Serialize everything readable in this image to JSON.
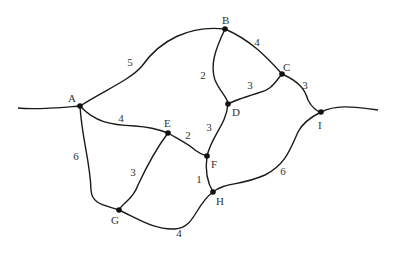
{
  "diagram": {
    "type": "weighted-graph",
    "nodes": [
      {
        "id": "A",
        "label": "A",
        "x": 80,
        "y": 106,
        "lx": 68,
        "ly": 102
      },
      {
        "id": "B",
        "label": "B",
        "x": 225,
        "y": 29,
        "lx": 222,
        "ly": 24
      },
      {
        "id": "C",
        "label": "C",
        "x": 282,
        "y": 74,
        "lx": 283,
        "ly": 71
      },
      {
        "id": "D",
        "label": "D",
        "x": 228,
        "y": 104,
        "lx": 232,
        "ly": 116
      },
      {
        "id": "E",
        "label": "E",
        "x": 168,
        "y": 133,
        "lx": 164,
        "ly": 127
      },
      {
        "id": "F",
        "label": "F",
        "x": 207,
        "y": 156,
        "lx": 211,
        "ly": 168
      },
      {
        "id": "G",
        "label": "G",
        "x": 119,
        "y": 210,
        "lx": 111,
        "ly": 224
      },
      {
        "id": "H",
        "label": "H",
        "x": 213,
        "y": 192,
        "lx": 216,
        "ly": 205
      },
      {
        "id": "I",
        "label": "I",
        "x": 321,
        "y": 112,
        "lx": 318,
        "ly": 129
      }
    ],
    "edges": [
      {
        "from": "A",
        "to": "B",
        "weight": "5",
        "wx": 130,
        "wy": 66,
        "path": "M80,106 C105,90 130,80 142,66 C160,40 190,25 225,29"
      },
      {
        "from": "A",
        "to": "E",
        "weight": "4",
        "wx": 121,
        "wy": 122,
        "path": "M80,106 C95,122 110,125 135,126 C150,127 160,130 168,133"
      },
      {
        "from": "A",
        "to": "G",
        "weight": "6",
        "wx": 76,
        "wy": 160,
        "path": "M80,106 C82,140 90,160 91,190 C92,205 105,205 119,210"
      },
      {
        "from": "B",
        "to": "C",
        "weight": "4",
        "wx": 257,
        "wy": 46,
        "path": "M225,29 C250,40 265,55 282,74"
      },
      {
        "from": "B",
        "to": "D",
        "weight": "2",
        "wx": 203,
        "wy": 79,
        "path": "M225,29 C215,50 210,65 215,80 C220,92 228,98 228,104"
      },
      {
        "from": "C",
        "to": "D",
        "weight": "3",
        "wx": 250,
        "wy": 89,
        "path": "M282,74 C275,82 272,90 258,93 C245,97 235,100 228,104"
      },
      {
        "from": "C",
        "to": "I",
        "weight": "3",
        "wx": 305,
        "wy": 89,
        "path": "M282,74 C300,82 305,90 308,100 C312,108 318,112 321,112"
      },
      {
        "from": "D",
        "to": "F",
        "weight": "3",
        "wx": 209,
        "wy": 131,
        "path": "M228,104 C226,125 212,135 207,156"
      },
      {
        "from": "E",
        "to": "F",
        "weight": "2",
        "wx": 188,
        "wy": 139,
        "path": "M168,133 C180,140 190,145 195,150 C200,154 204,155 207,156"
      },
      {
        "from": "E",
        "to": "G",
        "weight": "3",
        "wx": 133,
        "wy": 176,
        "path": "M168,133 C155,150 145,170 138,185 C133,200 122,203 119,210"
      },
      {
        "from": "F",
        "to": "H",
        "weight": "1",
        "wx": 199,
        "wy": 183,
        "path": "M207,156 C205,170 207,182 213,192"
      },
      {
        "from": "G",
        "to": "H",
        "weight": "4",
        "wx": 179,
        "wy": 237,
        "path": "M119,210 C140,220 155,230 175,229 C195,228 195,205 213,192"
      },
      {
        "from": "H",
        "to": "I",
        "weight": "6",
        "wx": 283,
        "wy": 175,
        "path": "M213,192 C225,182 240,186 265,175 C285,165 290,150 298,132 C303,122 315,115 321,112"
      }
    ],
    "tails": [
      {
        "id": "left-tail",
        "path": "M18,108 C35,110 55,108 80,106"
      },
      {
        "id": "right-tail",
        "path": "M321,112 C335,105 350,106 378,110"
      }
    ]
  }
}
